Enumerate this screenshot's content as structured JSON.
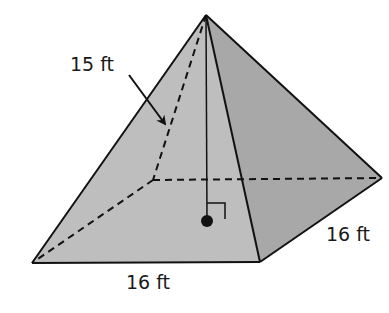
{
  "figure": {
    "type": "square pyramid",
    "colors": {
      "background": "#ffffff",
      "front_face": "#bdbdbd",
      "right_face": "#a9a9a9",
      "edge": "#111111"
    },
    "labels": {
      "slant_height": "15 ft",
      "base_front_edge": "16 ft",
      "base_right_edge": "16 ft"
    },
    "markers": {
      "height_line": "apex-to-base-center",
      "right_angle": true,
      "center_dot": true,
      "slant_arrow": true
    }
  }
}
